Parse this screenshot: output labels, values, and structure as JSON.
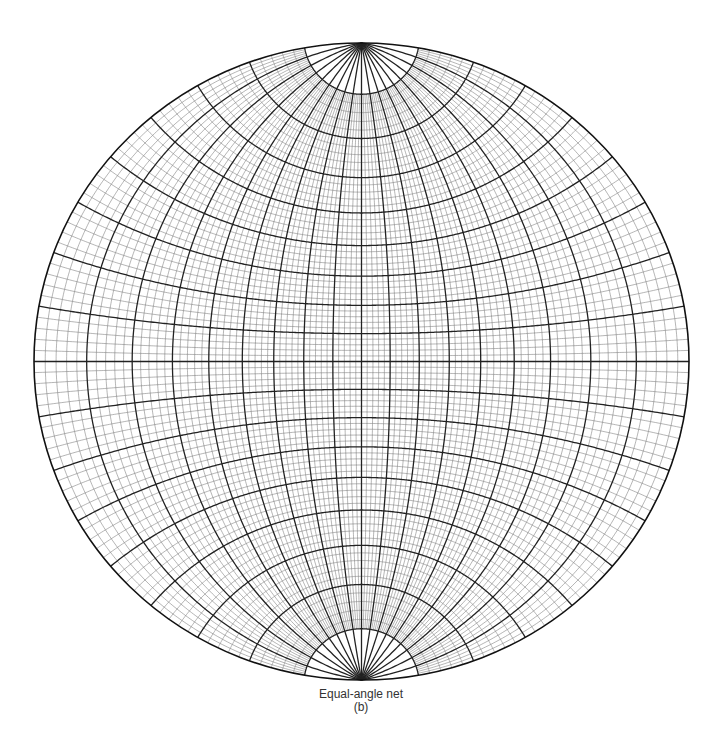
{
  "figure": {
    "title": "Equal-angle net",
    "sublabel": "(b)"
  },
  "net": {
    "type": "wulff-stereonet",
    "projection": "equal-angle",
    "center": [
      361.5,
      361.5
    ],
    "radius_x": 327.5,
    "radius_y": 318.5,
    "minor_interval_deg": 2,
    "major_interval_deg": 10,
    "pole_cutoff_deg": 80,
    "colors": {
      "minor_line": "#777777",
      "major_line": "#222222",
      "outline": "#111111",
      "background": "#ffffff"
    }
  }
}
